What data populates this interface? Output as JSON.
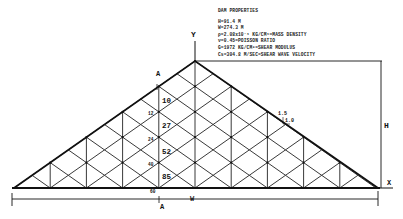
{
  "properties": {
    "title": "DAM PROPERTIES",
    "lines": [
      "H=91.4 M",
      "W=274.3 M",
      "ρ=2.08x10⁻³ KG/CM³=MASS DENSITY",
      "ν=0.45=POISSON RATIO",
      "G=1972 KG/CM²=SHEAR MODULUS",
      "Cs=304.8 M/SEC=SHEAR WAVE VELOCITY"
    ]
  },
  "axes": {
    "y": "Y",
    "x": "X"
  },
  "dimensions": {
    "height": "H",
    "width": "W"
  },
  "section": {
    "top": "A",
    "bottom": "A"
  },
  "slope": {
    "horizontal": "1.5",
    "vertical": "1.0"
  },
  "depth_labels": [
    "12",
    "24",
    "40",
    "60"
  ],
  "element_labels": [
    "10",
    "27",
    "52",
    "85"
  ]
}
